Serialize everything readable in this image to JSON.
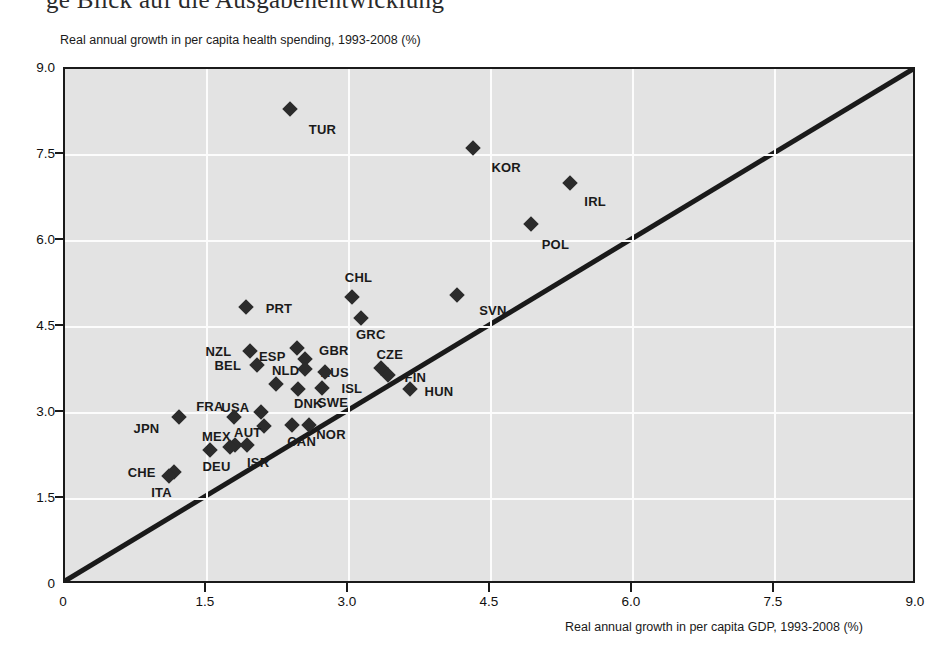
{
  "page": {
    "bleed_text": "ge Blick auf die Ausgabenentwicklung"
  },
  "chart_data": {
    "type": "scatter",
    "title": "",
    "ylabel": "Real annual growth in per capita health spending, 1993-2008 (%)",
    "xlabel": "Real annual growth in per capita GDP, 1993-2008 (%)",
    "xlim": [
      0,
      9
    ],
    "ylim": [
      0,
      9
    ],
    "xticks": [
      "0",
      "1.5",
      "3.0",
      "4.5",
      "6.0",
      "7.5",
      "9.0"
    ],
    "xtick_values": [
      0,
      1.5,
      3.0,
      4.5,
      6.0,
      7.5,
      9.0
    ],
    "yticks": [
      "0",
      "1.5",
      "3.0",
      "4.5",
      "6.0",
      "7.5",
      "9.0"
    ],
    "ytick_values": [
      0,
      1.5,
      3.0,
      4.5,
      6.0,
      7.5,
      9.0
    ],
    "grid": true,
    "legend": "none",
    "reference_line": {
      "name": "y=x diagonal",
      "from": [
        0,
        0
      ],
      "to": [
        9,
        9
      ]
    },
    "points": [
      {
        "label": "TUR",
        "x": 2.38,
        "y": 8.3,
        "lx": 2.72,
        "ly": 7.95
      },
      {
        "label": "KOR",
        "x": 4.31,
        "y": 7.62,
        "lx": 4.66,
        "ly": 7.29
      },
      {
        "label": "IRL",
        "x": 5.33,
        "y": 7.02,
        "lx": 5.6,
        "ly": 6.7
      },
      {
        "label": "POL",
        "x": 4.92,
        "y": 6.29,
        "lx": 5.18,
        "ly": 5.95
      },
      {
        "label": "CHL",
        "x": 3.03,
        "y": 5.02,
        "lx": 3.1,
        "ly": 5.38
      },
      {
        "label": "SVN",
        "x": 4.14,
        "y": 5.05,
        "lx": 4.52,
        "ly": 4.79
      },
      {
        "label": "PRT",
        "x": 1.91,
        "y": 4.85,
        "lx": 2.26,
        "ly": 4.84
      },
      {
        "label": "GRC",
        "x": 3.13,
        "y": 4.66,
        "lx": 3.23,
        "ly": 4.38
      },
      {
        "label": "GBR",
        "x": 2.53,
        "y": 3.94,
        "lx": 2.84,
        "ly": 4.1
      },
      {
        "label": "ESP",
        "x": 2.45,
        "y": 4.13,
        "lx": 2.19,
        "ly": 4.0
      },
      {
        "label": "NZL",
        "x": 1.95,
        "y": 4.09,
        "lx": 1.62,
        "ly": 4.09
      },
      {
        "label": "BEL",
        "x": 2.03,
        "y": 3.83,
        "lx": 1.72,
        "ly": 3.83
      },
      {
        "label": "AUS",
        "x": 2.53,
        "y": 3.76,
        "lx": 2.85,
        "ly": 3.72
      },
      {
        "label": "CZE",
        "x": 3.34,
        "y": 3.79,
        "lx": 3.43,
        "ly": 4.03
      },
      {
        "label": "FIN",
        "x": 3.41,
        "y": 3.67,
        "lx": 3.7,
        "ly": 3.62
      },
      {
        "label": "ISL",
        "x": 2.75,
        "y": 3.72,
        "lx": 3.03,
        "ly": 3.44
      },
      {
        "label": "HUN",
        "x": 3.64,
        "y": 3.42,
        "lx": 3.95,
        "ly": 3.38
      },
      {
        "label": "NLD",
        "x": 2.23,
        "y": 3.5,
        "lx": 2.33,
        "ly": 3.75
      },
      {
        "label": "DNK",
        "x": 2.46,
        "y": 3.42,
        "lx": 2.57,
        "ly": 3.18
      },
      {
        "label": "SWE",
        "x": 2.71,
        "y": 3.44,
        "lx": 2.83,
        "ly": 3.2
      },
      {
        "label": "USA",
        "x": 2.07,
        "y": 3.01,
        "lx": 1.8,
        "ly": 3.1
      },
      {
        "label": "FRA",
        "x": 1.78,
        "y": 2.93,
        "lx": 1.53,
        "ly": 3.13
      },
      {
        "label": "JPN",
        "x": 1.2,
        "y": 2.93,
        "lx": 0.86,
        "ly": 2.73
      },
      {
        "label": "AUT",
        "x": 2.1,
        "y": 2.77,
        "lx": 1.93,
        "ly": 2.67
      },
      {
        "label": "CAN",
        "x": 2.4,
        "y": 2.79,
        "lx": 2.5,
        "ly": 2.52
      },
      {
        "label": "NOR",
        "x": 2.58,
        "y": 2.79,
        "lx": 2.81,
        "ly": 2.63
      },
      {
        "label": "MEX",
        "x": 1.8,
        "y": 2.44,
        "lx": 1.6,
        "ly": 2.6
      },
      {
        "label": "DEU",
        "x": 1.53,
        "y": 2.35,
        "lx": 1.6,
        "ly": 2.07
      },
      {
        "label": "ISR",
        "x": 1.74,
        "y": 2.41,
        "lx": 2.04,
        "ly": 2.14
      },
      {
        "label": "ISR2",
        "x": 1.92,
        "y": 2.44,
        "lx": -1,
        "ly": -1
      },
      {
        "label": "CHE",
        "x": 1.15,
        "y": 1.97,
        "lx": 0.81,
        "ly": 1.97
      },
      {
        "label": "ITA",
        "x": 1.1,
        "y": 1.9,
        "lx": 1.02,
        "ly": 1.63
      }
    ]
  }
}
